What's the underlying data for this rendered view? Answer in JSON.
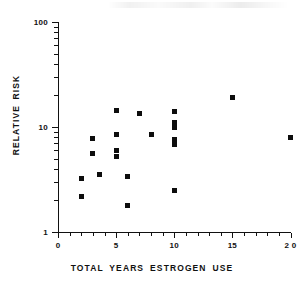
{
  "figure": {
    "name": "relative-risk-scatter",
    "background": "#ffffff",
    "ink_color": "#111111",
    "marker_color": "#0d0d0d"
  },
  "chart_data": {
    "type": "scatter",
    "title": "",
    "subtitle": "",
    "xlabel": "TOTAL YEARS  ESTROGEN USE",
    "ylabel": "RELATIVE RISK",
    "xscale": "linear",
    "yscale": "log",
    "xlim": [
      0,
      20
    ],
    "ylim": [
      1,
      100
    ],
    "grid": false,
    "legend": null,
    "xticks": [
      0,
      5,
      10,
      15,
      20
    ],
    "xticklabels": [
      "0",
      "5",
      "10",
      "15",
      "2 0"
    ],
    "xminorticks": [
      1,
      2,
      3,
      4,
      6,
      7,
      8,
      9,
      11,
      12,
      13,
      14,
      16,
      17,
      18,
      19
    ],
    "yticks": [
      1,
      10,
      100
    ],
    "yticklabels": [
      "1",
      "10",
      "100"
    ],
    "yminorticks": [
      2,
      3,
      4,
      5,
      6,
      7,
      8,
      9,
      20,
      30,
      40,
      50,
      60,
      70,
      80,
      90
    ],
    "x": [
      2,
      2,
      3,
      3,
      3.6,
      5,
      5,
      5,
      5,
      6,
      6,
      7,
      8,
      10,
      10,
      10,
      10,
      10,
      10,
      15,
      20
    ],
    "y": [
      3.2,
      2.2,
      7.8,
      5.6,
      3.5,
      14.5,
      8.5,
      6.0,
      5.2,
      3.4,
      1.8,
      13.5,
      8.5,
      14.0,
      11.0,
      10.0,
      7.6,
      6.8,
      2.5,
      19.0,
      8.0
    ],
    "points": [
      {
        "x": 2,
        "y": 3.2
      },
      {
        "x": 2,
        "y": 2.2
      },
      {
        "x": 3,
        "y": 7.8
      },
      {
        "x": 3,
        "y": 5.6
      },
      {
        "x": 3.6,
        "y": 3.5
      },
      {
        "x": 5,
        "y": 14.5
      },
      {
        "x": 5,
        "y": 8.5
      },
      {
        "x": 5,
        "y": 6.0
      },
      {
        "x": 5,
        "y": 5.2
      },
      {
        "x": 6,
        "y": 3.4
      },
      {
        "x": 6,
        "y": 1.8
      },
      {
        "x": 7,
        "y": 13.5
      },
      {
        "x": 8,
        "y": 8.5
      },
      {
        "x": 10,
        "y": 14.0
      },
      {
        "x": 10,
        "y": 11.0
      },
      {
        "x": 10,
        "y": 10.0
      },
      {
        "x": 10,
        "y": 7.6
      },
      {
        "x": 10,
        "y": 6.8
      },
      {
        "x": 10,
        "y": 2.5
      },
      {
        "x": 15,
        "y": 19.0
      },
      {
        "x": 20,
        "y": 8.0
      }
    ],
    "marker": "filled-square",
    "n_points": 21
  }
}
